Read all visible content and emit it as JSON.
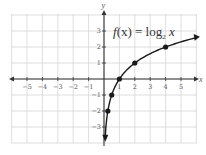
{
  "chart_data": {
    "type": "line",
    "function_label": {
      "prefix": "f(x) = log",
      "subscript": "2",
      "suffix": " x"
    },
    "xlabel": "x",
    "ylabel": "y",
    "xlim": [
      -6,
      6
    ],
    "ylim": [
      -4,
      4
    ],
    "grid": true,
    "x_ticks": [
      -5,
      -4,
      -3,
      -2,
      -1,
      1,
      2,
      3,
      4,
      5
    ],
    "y_ticks": [
      -3,
      -2,
      -1,
      1,
      2,
      3
    ],
    "x_tick_labels": [
      "−5",
      "−4",
      "−3",
      "−2",
      "−1",
      "1",
      "2",
      "3",
      "4",
      "5"
    ],
    "y_tick_labels": [
      "−3",
      "−2",
      "−1",
      "1",
      "2",
      "3"
    ],
    "series": [
      {
        "name": "f(x) = log2 x",
        "points": [
          {
            "x": 0.25,
            "y": -2
          },
          {
            "x": 0.5,
            "y": -1
          },
          {
            "x": 1,
            "y": 0
          },
          {
            "x": 2,
            "y": 1
          },
          {
            "x": 4,
            "y": 2
          }
        ],
        "arrow_ends": true
      }
    ],
    "colors": {
      "curve": "#1a1a1a",
      "axis": "#333333",
      "grid": "#d6d6d6",
      "text": "#555555"
    }
  }
}
